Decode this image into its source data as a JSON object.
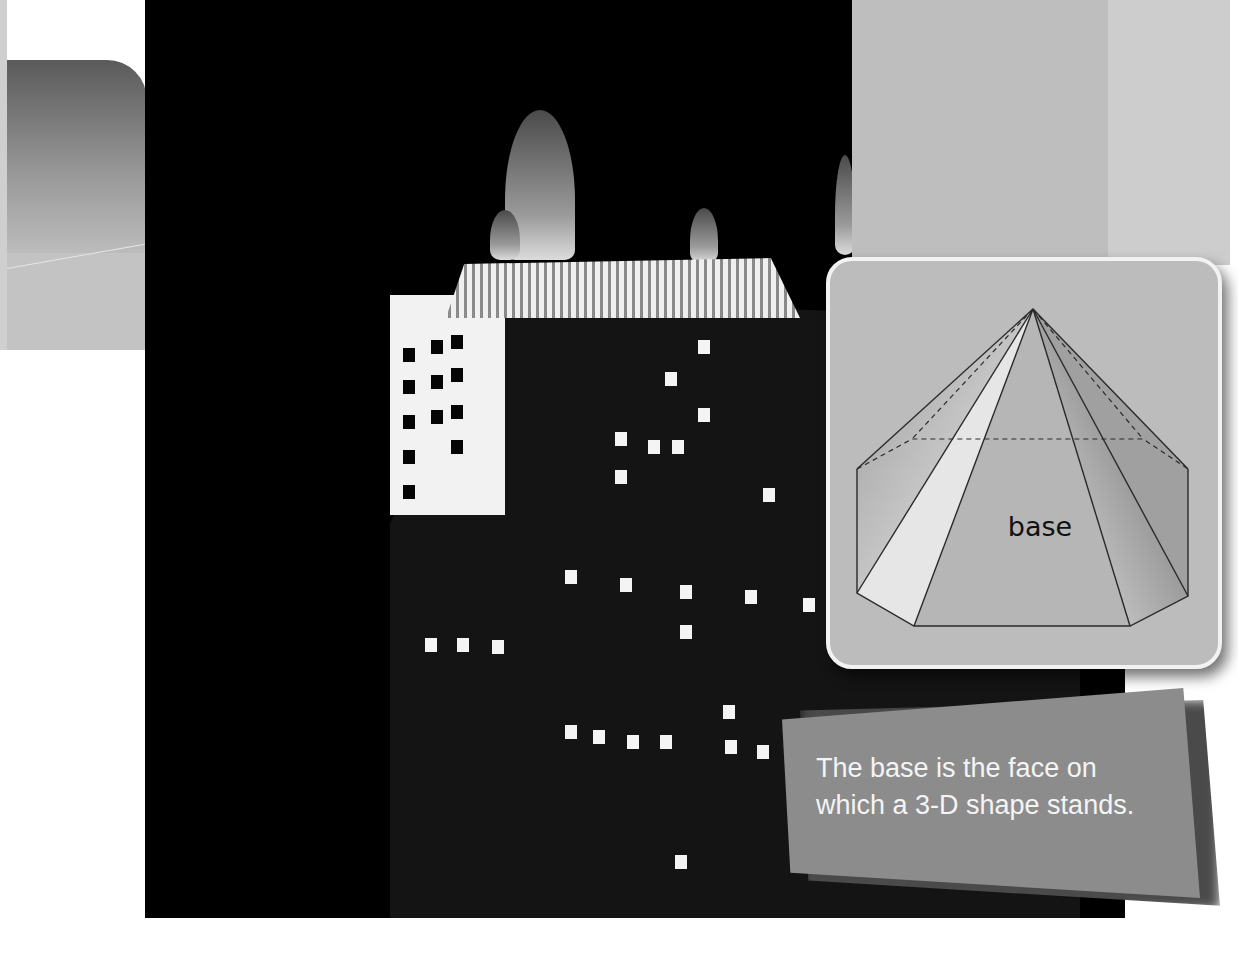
{
  "figure": {
    "label": "base",
    "shape": "heptagonal-pyramid"
  },
  "caption": {
    "line1": "The base is the face on",
    "line2": "which a 3-D shape stands."
  },
  "colors": {
    "photo_bg": "#000000",
    "card_bg": "#bcbcbc",
    "card_border": "#f2f2f2",
    "caption_bg": "#8c8c8c",
    "caption_text": "#f4f4f4"
  }
}
